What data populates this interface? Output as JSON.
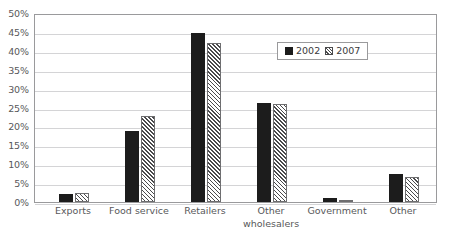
{
  "chart_data": {
    "type": "bar",
    "title": "",
    "subtitle": "",
    "xlabel": "",
    "ylabel": "",
    "ylim": [
      0,
      50
    ],
    "y_tick_step": 5,
    "y_unit": "%",
    "grid": true,
    "legend_position": "inside-top-right",
    "categories": [
      "Exports",
      "Food service",
      "Retailers",
      "Other wholesalers",
      "Government",
      "Other"
    ],
    "category_lines": [
      [
        "Exports"
      ],
      [
        "Food service"
      ],
      [
        "Retailers"
      ],
      [
        "Other",
        "wholesalers"
      ],
      [
        "Government"
      ],
      [
        "Other"
      ]
    ],
    "y_ticks": [
      "0%",
      "5%",
      "10%",
      "15%",
      "20%",
      "25%",
      "30%",
      "35%",
      "40%",
      "45%",
      "50%"
    ],
    "y_tick_values": [
      0,
      5,
      10,
      15,
      20,
      25,
      30,
      35,
      40,
      45,
      50
    ],
    "series": [
      {
        "name": "2002",
        "fill": "solid-black",
        "color": "#1c1c1c",
        "values": [
          2.2,
          18.7,
          44.8,
          26.3,
          1.1,
          7.4
        ]
      },
      {
        "name": "2007",
        "fill": "diagonal-hatch",
        "color": "#4a4a4c",
        "values": [
          2.3,
          22.8,
          42.1,
          26.0,
          0.3,
          6.5
        ]
      }
    ]
  },
  "legend": {
    "entries": [
      {
        "label": "2002"
      },
      {
        "label": "2007"
      }
    ]
  },
  "colors": {
    "series_2002": "#1c1c1c",
    "series_2007": "#4a4a4c",
    "gridline": "#d4d4d6",
    "frame": "#9a9a9c",
    "text": "#58585a",
    "background": "#ffffff"
  }
}
